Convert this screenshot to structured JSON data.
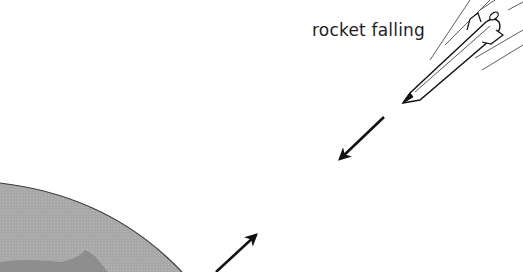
{
  "diagram": {
    "labels": {
      "rocket": "rocket falling"
    },
    "elements": [
      {
        "name": "earth",
        "type": "planet-arc",
        "fill": "#a9a9a9"
      },
      {
        "name": "rocket",
        "type": "falling-rocket"
      },
      {
        "name": "downward-arrow",
        "direction": "down-left"
      },
      {
        "name": "upward-arrow",
        "direction": "up-right"
      }
    ],
    "colors": {
      "earth_fill": "#a9a9a9",
      "earth_outline": "#3a3a3a",
      "ink": "#111111"
    }
  }
}
